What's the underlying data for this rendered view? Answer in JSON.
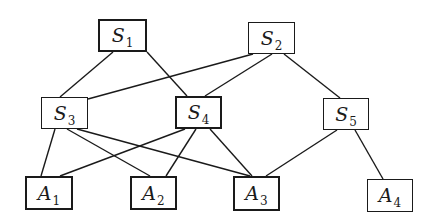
{
  "diagram": {
    "type": "hierarchy-graph",
    "nodes": [
      {
        "id": "S1",
        "letter": "S",
        "sub": "1",
        "x": 98,
        "y": 19,
        "w": 49,
        "h": 33,
        "thick": true
      },
      {
        "id": "S2",
        "letter": "S",
        "sub": "2",
        "x": 248,
        "y": 22,
        "w": 47,
        "h": 32,
        "thick": false
      },
      {
        "id": "S3",
        "letter": "S",
        "sub": "3",
        "x": 41,
        "y": 97,
        "w": 47,
        "h": 32,
        "thick": false
      },
      {
        "id": "S4",
        "letter": "S",
        "sub": "4",
        "x": 175,
        "y": 96,
        "w": 47,
        "h": 33,
        "thick": true
      },
      {
        "id": "S5",
        "letter": "S",
        "sub": "5",
        "x": 323,
        "y": 98,
        "w": 46,
        "h": 32,
        "thick": false
      },
      {
        "id": "A1",
        "letter": "A",
        "sub": "1",
        "x": 25,
        "y": 176,
        "w": 48,
        "h": 34,
        "thick": true
      },
      {
        "id": "A2",
        "letter": "A",
        "sub": "2",
        "x": 130,
        "y": 176,
        "w": 47,
        "h": 34,
        "thick": true
      },
      {
        "id": "A3",
        "letter": "A",
        "sub": "3",
        "x": 233,
        "y": 176,
        "w": 47,
        "h": 35,
        "thick": true
      },
      {
        "id": "A4",
        "letter": "A",
        "sub": "4",
        "x": 367,
        "y": 179,
        "w": 46,
        "h": 33,
        "thick": false
      }
    ],
    "edges": [
      {
        "from": "S1",
        "to": "S3",
        "x1": 113,
        "y1": 52,
        "x2": 60,
        "y2": 97
      },
      {
        "from": "S1",
        "to": "S4",
        "x1": 147,
        "y1": 52,
        "x2": 187,
        "y2": 96
      },
      {
        "from": "S2",
        "to": "S3",
        "x1": 253,
        "y1": 54,
        "x2": 88,
        "y2": 99
      },
      {
        "from": "S2",
        "to": "S4",
        "x1": 272,
        "y1": 54,
        "x2": 205,
        "y2": 96
      },
      {
        "from": "S2",
        "to": "S5",
        "x1": 284,
        "y1": 54,
        "x2": 340,
        "y2": 98
      },
      {
        "from": "S3",
        "to": "A1",
        "x1": 55,
        "y1": 129,
        "x2": 41,
        "y2": 176
      },
      {
        "from": "S3",
        "to": "A2",
        "x1": 67,
        "y1": 129,
        "x2": 150,
        "y2": 176
      },
      {
        "from": "S3",
        "to": "A3",
        "x1": 77,
        "y1": 129,
        "x2": 250,
        "y2": 176
      },
      {
        "from": "S4",
        "to": "A1",
        "x1": 185,
        "y1": 129,
        "x2": 60,
        "y2": 176
      },
      {
        "from": "S4",
        "to": "A2",
        "x1": 196,
        "y1": 129,
        "x2": 166,
        "y2": 176
      },
      {
        "from": "S4",
        "to": "A3",
        "x1": 210,
        "y1": 129,
        "x2": 252,
        "y2": 176
      },
      {
        "from": "S5",
        "to": "A3",
        "x1": 337,
        "y1": 130,
        "x2": 266,
        "y2": 176
      },
      {
        "from": "S5",
        "to": "A4",
        "x1": 355,
        "y1": 130,
        "x2": 383,
        "y2": 179
      }
    ],
    "colors": {
      "stroke": "#1a1a1a",
      "background": "#ffffff"
    }
  }
}
